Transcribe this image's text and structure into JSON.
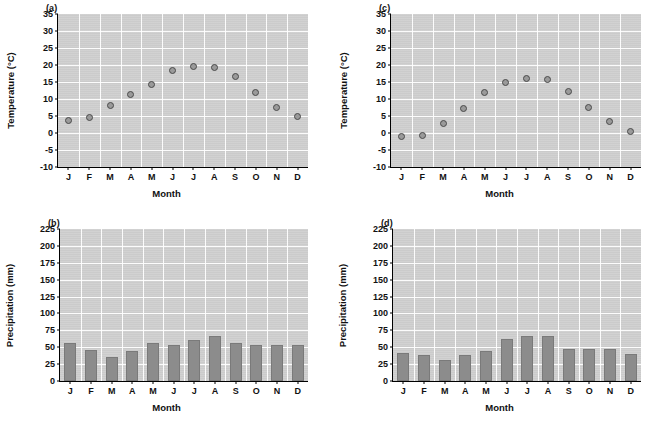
{
  "figure": {
    "months": [
      "J",
      "F",
      "M",
      "A",
      "M",
      "J",
      "J",
      "A",
      "S",
      "O",
      "N",
      "D"
    ],
    "xlabel": "Month",
    "temp_ylabel": "Temperature (°C)",
    "precip_ylabel": "Precipitation (mm)",
    "temp_ticks": [
      "35",
      "30",
      "25",
      "20",
      "15",
      "10",
      "5",
      "0",
      "-5",
      "-10"
    ],
    "precip_ticks": [
      "225",
      "200",
      "175",
      "150",
      "125",
      "100",
      "75",
      "50",
      "25",
      "0"
    ],
    "colors": {
      "plot_background": "#cfcfcf",
      "gridline": "#ffffff",
      "marker_fill": "#9a9a9a",
      "marker_edge": "#4a4a4a",
      "bar_fill": "#8c8c8c",
      "axis": "#000000",
      "text": "#111111"
    }
  },
  "chart_data": [
    {
      "id": "panel-a",
      "type": "scatter",
      "title": "(a)",
      "xlabel": "Month",
      "ylabel": "Temperature (°C)",
      "categories": [
        "J",
        "F",
        "M",
        "A",
        "M",
        "J",
        "J",
        "A",
        "S",
        "O",
        "N",
        "D"
      ],
      "values": [
        3.7,
        4.7,
        8.1,
        11.2,
        14.4,
        18.3,
        19.7,
        19.3,
        16.7,
        11.8,
        7.5,
        4.8
      ],
      "ylim": [
        -10,
        35
      ],
      "ytick_step": 5,
      "grid": true
    },
    {
      "id": "panel-b",
      "type": "bar",
      "title": "(b)",
      "xlabel": "Month",
      "ylabel": "Precipitation (mm)",
      "categories": [
        "J",
        "F",
        "M",
        "A",
        "M",
        "J",
        "J",
        "A",
        "S",
        "O",
        "N",
        "D"
      ],
      "values": [
        56,
        46,
        36,
        44,
        57,
        54,
        60,
        66,
        57,
        53,
        53,
        53
      ],
      "ylim": [
        0,
        225
      ],
      "ytick_step": 25,
      "grid": true
    },
    {
      "id": "panel-c",
      "type": "scatter",
      "title": "(c)",
      "xlabel": "Month",
      "ylabel": "Temperature (°C)",
      "categories": [
        "J",
        "F",
        "M",
        "A",
        "M",
        "J",
        "J",
        "A",
        "S",
        "O",
        "N",
        "D"
      ],
      "values": [
        -1.1,
        -0.8,
        2.7,
        7.3,
        11.9,
        14.8,
        15.9,
        15.8,
        12.1,
        7.4,
        3.3,
        0.3
      ],
      "ylim": [
        -10,
        35
      ],
      "ytick_step": 5,
      "grid": true
    },
    {
      "id": "panel-d",
      "type": "bar",
      "title": "(d)",
      "xlabel": "Month",
      "ylabel": "Precipitation (mm)",
      "categories": [
        "J",
        "F",
        "M",
        "A",
        "M",
        "J",
        "J",
        "A",
        "S",
        "O",
        "N",
        "D"
      ],
      "values": [
        42,
        39,
        31,
        39,
        44,
        62,
        67,
        67,
        48,
        48,
        48,
        40
      ],
      "ylim": [
        0,
        225
      ],
      "ytick_step": 25,
      "grid": true
    }
  ]
}
